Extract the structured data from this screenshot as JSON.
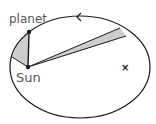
{
  "diagram": {
    "type": "kepler-second-law",
    "labels": {
      "planet": "planet",
      "sun": "Sun",
      "focus_marker": "×"
    },
    "colors": {
      "stroke": "#1a1a1a",
      "wedge_fill": "#cccccc",
      "text": "#555555"
    }
  }
}
